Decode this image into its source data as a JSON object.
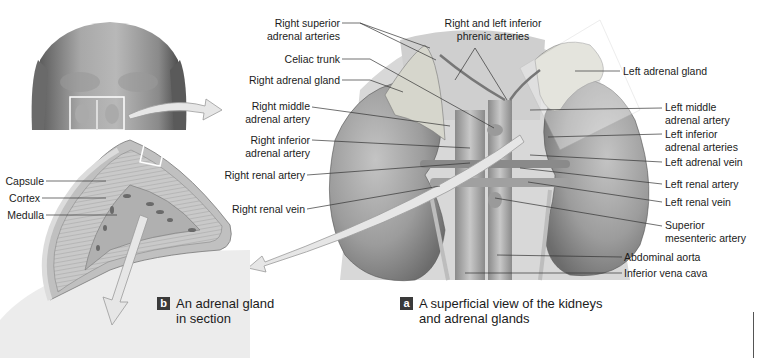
{
  "figure": {
    "panel_a": {
      "badge": "a",
      "caption_line1": "A superficial view of the kidneys",
      "caption_line2": "and adrenal glands",
      "labels_left": [
        {
          "line1": "Right superior",
          "line2": "adrenal arteries"
        },
        {
          "line1": "Celiac trunk",
          "line2": ""
        },
        {
          "line1": "Right adrenal gland",
          "line2": ""
        },
        {
          "line1": "Right middle",
          "line2": "adrenal artery"
        },
        {
          "line1": "Right inferior",
          "line2": "adrenal artery"
        },
        {
          "line1": "Right renal artery",
          "line2": ""
        },
        {
          "line1": "Right renal vein",
          "line2": ""
        }
      ],
      "label_top": {
        "line1": "Right and left inferior",
        "line2": "phrenic arteries"
      },
      "labels_right": [
        {
          "line1": "Left adrenal gland",
          "line2": ""
        },
        {
          "line1": "Left middle",
          "line2": "adrenal artery"
        },
        {
          "line1": "Left inferior",
          "line2": "adrenal arteries"
        },
        {
          "line1": "Left adrenal vein",
          "line2": ""
        },
        {
          "line1": "Left renal artery",
          "line2": ""
        },
        {
          "line1": "Left renal vein",
          "line2": ""
        },
        {
          "line1": "Superior",
          "line2": "mesenteric artery"
        },
        {
          "line1": "Abdominal aorta",
          "line2": ""
        },
        {
          "line1": "Inferior vena cava",
          "line2": ""
        }
      ]
    },
    "panel_b": {
      "badge": "b",
      "caption_line1": "An adrenal gland",
      "caption_line2": "in section",
      "labels": [
        {
          "text": "Capsule"
        },
        {
          "text": "Cortex"
        },
        {
          "text": "Medulla"
        }
      ]
    },
    "colors": {
      "kidney": "#9a9a9a",
      "adrenal": "#d4d4c8",
      "vessel": "#7a7a7a",
      "arrow_fill": "#e6e6e6",
      "badge_bg": "#3a3a3a",
      "leader_line": "#333333"
    }
  }
}
